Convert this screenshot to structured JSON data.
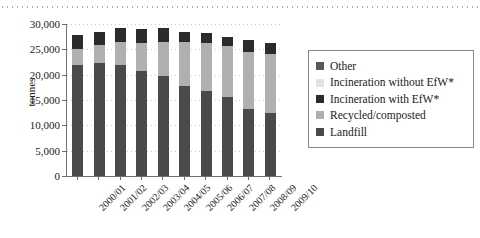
{
  "chart_data": {
    "type": "bar",
    "stacked": true,
    "title": "",
    "xlabel": "",
    "ylabel": "tonnes",
    "ylim": [
      0,
      30000
    ],
    "yticks": [
      0,
      5000,
      10000,
      15000,
      20000,
      25000,
      30000
    ],
    "ytick_labels": [
      "0",
      "5,000",
      "10,000",
      "15,000",
      "20,000",
      "25,000",
      "30,000"
    ],
    "grid": true,
    "legend_position": "right",
    "categories": [
      "2000/01",
      "2001/02",
      "2002/03",
      "2003/04",
      "2004/05",
      "2005/06",
      "2006/07",
      "2007/08",
      "2008/09",
      "2009/10"
    ],
    "series": [
      {
        "name": "Landfill",
        "color": "#4a4a4a",
        "values": [
          22000,
          22300,
          22000,
          20800,
          19700,
          17800,
          16700,
          15500,
          13300,
          12500
        ]
      },
      {
        "name": "Recycled/composted",
        "color": "#b0b0b0",
        "values": [
          3100,
          3500,
          4400,
          5500,
          6800,
          8700,
          9600,
          10200,
          11100,
          11500
        ]
      },
      {
        "name": "Incineration with EfW*",
        "color": "#2b2b2b",
        "values": [
          2700,
          2700,
          2800,
          2700,
          2800,
          2000,
          1900,
          1800,
          2400,
          2300
        ]
      },
      {
        "name": "Incineration without EfW*",
        "color": "#e3e3e3",
        "values": [
          0,
          0,
          0,
          0,
          0,
          0,
          0,
          0,
          0,
          0
        ]
      },
      {
        "name": "Other",
        "color": "#5a5a5a",
        "values": [
          0,
          0,
          0,
          0,
          0,
          0,
          0,
          0,
          0,
          0
        ]
      }
    ],
    "totals": [
      27800,
      28500,
      29200,
      29000,
      29300,
      28500,
      28200,
      27500,
      26800,
      26300
    ]
  },
  "legend": {
    "items": [
      {
        "label": "Other",
        "color": "#5a5a5a"
      },
      {
        "label": "Incineration without EfW*",
        "color": "#e3e3e3"
      },
      {
        "label": "Incineration with EfW*",
        "color": "#2b2b2b"
      },
      {
        "label": "Recycled/composted",
        "color": "#b0b0b0"
      },
      {
        "label": "Landfill",
        "color": "#4a4a4a"
      }
    ]
  }
}
